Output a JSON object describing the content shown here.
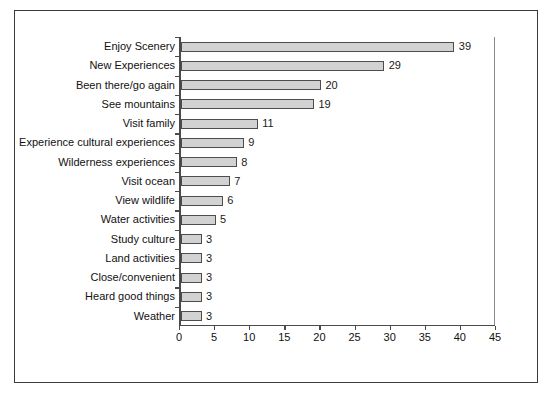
{
  "chart_data": {
    "type": "bar",
    "orientation": "horizontal",
    "title": "",
    "subtitle": "",
    "xlabel": "",
    "ylabel": "",
    "xlim": [
      0,
      45
    ],
    "xticks": [
      0,
      5,
      10,
      15,
      20,
      25,
      30,
      35,
      40,
      45
    ],
    "grid": false,
    "legend": null,
    "bar_fill_color": "#d2d2d2",
    "bar_border_color": "#4d4d4d",
    "axis_color": "#4a4a4a",
    "categories": [
      "Enjoy Scenery",
      "New Experiences",
      "Been there/go again",
      "See mountains",
      "Visit family",
      "Experience cultural experiences",
      "Wilderness experiences",
      "Visit ocean",
      "View wildlife",
      "Water activities",
      "Study culture",
      "Land activities",
      "Close/convenient",
      "Heard good things",
      "Weather"
    ],
    "values": [
      39,
      29,
      20,
      19,
      11,
      9,
      8,
      7,
      6,
      5,
      3,
      3,
      3,
      3,
      3
    ],
    "data_labels": [
      "39",
      "29",
      "20",
      "19",
      "11",
      "9",
      "8",
      "7",
      "6",
      "5",
      "3",
      "3",
      "3",
      "3",
      "3"
    ],
    "xtick_labels": [
      "0",
      "5",
      "10",
      "15",
      "20",
      "25",
      "30",
      "35",
      "40",
      "45"
    ]
  }
}
